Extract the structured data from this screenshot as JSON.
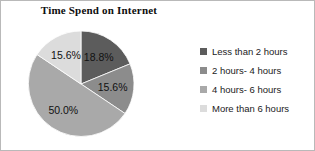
{
  "chart_data": {
    "type": "pie",
    "title": "Time Spend on Internet",
    "categories": [
      "Less than 2 hours",
      "2 hours- 4 hours",
      "4 hours- 6 hours",
      "More than 6 hours"
    ],
    "values": [
      18.8,
      15.6,
      50.0,
      15.6
    ],
    "value_labels": [
      "18.8%",
      "15.6%",
      "50.0%",
      "15.6%"
    ],
    "colors": [
      "#5c5c5c",
      "#8c8c8c",
      "#a9a9a9",
      "#dcdcdc"
    ],
    "start_angle_deg": 0,
    "direction": "clockwise",
    "legend_position": "right",
    "grid": false,
    "xlabel": "",
    "ylabel": ""
  },
  "legend": {
    "items": [
      {
        "label": "Less than 2 hours",
        "color": "#5c5c5c"
      },
      {
        "label": "2 hours- 4 hours",
        "color": "#8c8c8c"
      },
      {
        "label": "4 hours- 6 hours",
        "color": "#a9a9a9"
      },
      {
        "label": "More than 6 hours",
        "color": "#dcdcdc"
      }
    ]
  },
  "pie_geometry": {
    "cx": 80,
    "cy": 83,
    "r": 53
  }
}
